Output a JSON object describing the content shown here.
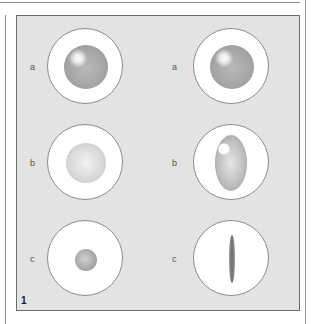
{
  "figure": {
    "number": "1",
    "columns": [
      {
        "rows": [
          {
            "label": "a",
            "shape": "large-sphere"
          },
          {
            "label": "b",
            "shape": "pale-sphere"
          },
          {
            "label": "c",
            "shape": "small-sphere"
          }
        ]
      },
      {
        "rows": [
          {
            "label": "a",
            "shape": "large-sphere"
          },
          {
            "label": "b",
            "shape": "ovoid"
          },
          {
            "label": "c",
            "shape": "needle"
          }
        ]
      }
    ],
    "colors": {
      "panel_background": "#e3e3e3",
      "dish_background": "#ffffff",
      "border": "#6d6d6d"
    }
  }
}
